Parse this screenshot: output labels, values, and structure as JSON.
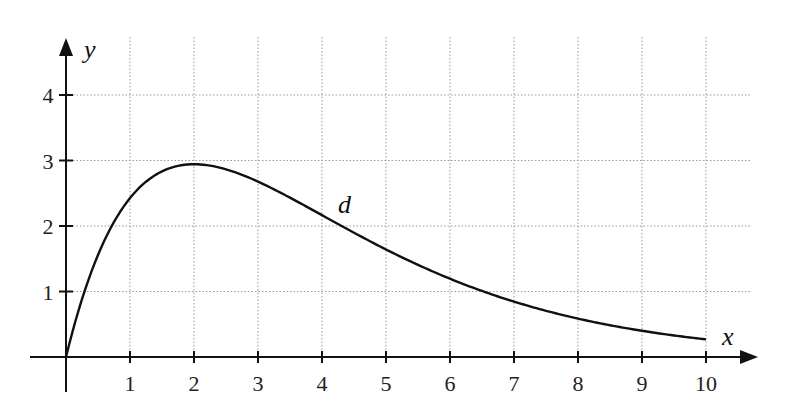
{
  "chart_data": {
    "type": "line",
    "title": "",
    "xlabel": "x",
    "ylabel": "y",
    "xlim": [
      0,
      10.7
    ],
    "ylim": [
      0,
      4.8
    ],
    "x_ticks": [
      1,
      2,
      3,
      4,
      5,
      6,
      7,
      8,
      9,
      10
    ],
    "y_ticks": [
      1,
      2,
      3,
      4
    ],
    "grid": true,
    "legend": null,
    "series": [
      {
        "name": "d",
        "formula_estimate": "d(x) = 4·x·e^(-x/2)",
        "x": [
          0,
          0.5,
          1,
          1.5,
          2,
          2.5,
          3,
          3.5,
          4,
          4.5,
          5,
          5.5,
          6,
          6.5,
          7,
          7.5,
          8,
          8.5,
          9,
          9.5,
          10
        ],
        "values": [
          0,
          1.56,
          2.43,
          2.83,
          2.94,
          2.87,
          2.68,
          2.43,
          2.17,
          1.9,
          1.64,
          1.4,
          1.19,
          1.01,
          0.85,
          0.71,
          0.59,
          0.48,
          0.4,
          0.33,
          0.27
        ]
      }
    ],
    "annotations": [
      {
        "text": "d",
        "x": 4.4,
        "y": 2.4
      }
    ]
  },
  "labels": {
    "x_axis": "x",
    "y_axis": "y",
    "curve": "d"
  }
}
